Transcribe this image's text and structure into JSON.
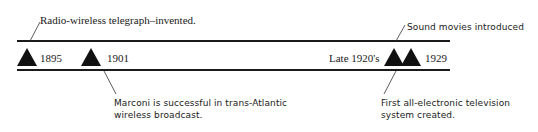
{
  "timeline": {
    "events": [
      {
        "year": "1895",
        "note": "Radio-wireless telegraph–invented.",
        "note_position": "above"
      },
      {
        "year": "1901",
        "note_lines": [
          "Marconi is successful in trans-Atlantic",
          "wireless broadcast."
        ],
        "note_position": "below"
      },
      {
        "year": "Late 1920's",
        "note_lines": [
          "First all-electronic television",
          "system created."
        ],
        "note_position": "below"
      },
      {
        "year": "1929",
        "note": "Sound movies introduced",
        "note_position": "above"
      }
    ],
    "marker_shape": "triangle-icon",
    "line_color": "#1a1a1a",
    "marker_color": "#111111"
  }
}
